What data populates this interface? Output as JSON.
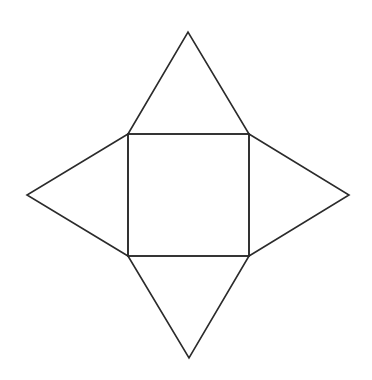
{
  "diagram": {
    "title": "",
    "stroke_color": "#2b2b2b",
    "background": "#ffffff",
    "base_square": {
      "x1": 128,
      "y1": 134,
      "x2": 249,
      "y2": 256
    },
    "triangles": [
      {
        "name": "top",
        "points": "128,134 188,32 249,134"
      },
      {
        "name": "right",
        "points": "249,134 349,195 249,256"
      },
      {
        "name": "bottom",
        "points": "128,256 189,358 249,256"
      },
      {
        "name": "left",
        "points": "128,134 27,195 128,256"
      }
    ]
  }
}
